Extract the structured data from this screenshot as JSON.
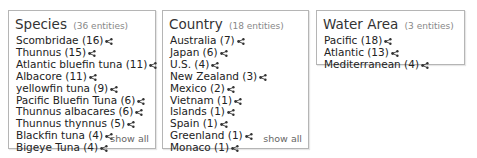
{
  "facets": {
    "species": {
      "title": "Species",
      "count_label": "(36 entities)",
      "items": [
        {
          "label": "Scombridae (16)"
        },
        {
          "label": "Thunnus (15)"
        },
        {
          "label": "Atlantic bluefin tuna (11)"
        },
        {
          "label": "Albacore (11)"
        },
        {
          "label": "yellowfin tuna (9)"
        },
        {
          "label": "Pacific Bluefin Tuna (6)"
        },
        {
          "label": "Thunnus albacares (6)"
        },
        {
          "label": "Thunnus thynnus (5)"
        },
        {
          "label": "Blackfin tuna (4)"
        },
        {
          "label": "Bigeye Tuna (4)"
        }
      ],
      "show_all": "show all"
    },
    "country": {
      "title": "Country",
      "count_label": "(18 entities)",
      "items": [
        {
          "label": "Australia (7)"
        },
        {
          "label": "Japan (6)"
        },
        {
          "label": "U.S. (4)"
        },
        {
          "label": "New Zealand (3)"
        },
        {
          "label": "Mexico (2)"
        },
        {
          "label": "Vietnam (1)"
        },
        {
          "label": "Islands (1)"
        },
        {
          "label": "Spain (1)"
        },
        {
          "label": "Greenland (1)"
        },
        {
          "label": "Monaco (1)"
        }
      ],
      "show_all": "show all"
    },
    "water_area": {
      "title": "Water Area",
      "count_label": "(3 entities)",
      "items": [
        {
          "label": "Pacific (18)"
        },
        {
          "label": "Atlantic (13)"
        },
        {
          "label": "Mediterranean (4)"
        }
      ]
    }
  },
  "icons": {
    "item_action": "share-network-icon"
  },
  "colors": {
    "border": "#b5b5b5",
    "text": "#222222",
    "muted": "#888888"
  }
}
